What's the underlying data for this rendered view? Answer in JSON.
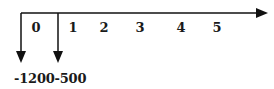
{
  "diagram": {
    "type": "cash-flow-timeline",
    "time_labels": [
      "0",
      "1",
      "2",
      "3",
      "4",
      "5"
    ],
    "cash_flows": [
      {
        "period": "0",
        "value": "-1200",
        "direction": "down"
      },
      {
        "period": "1",
        "value": "-500",
        "direction": "down"
      }
    ],
    "values_text": "-1200-500",
    "colors": {
      "line": "#111111",
      "text": "#1a1a1a",
      "background": "#ffffff"
    }
  }
}
